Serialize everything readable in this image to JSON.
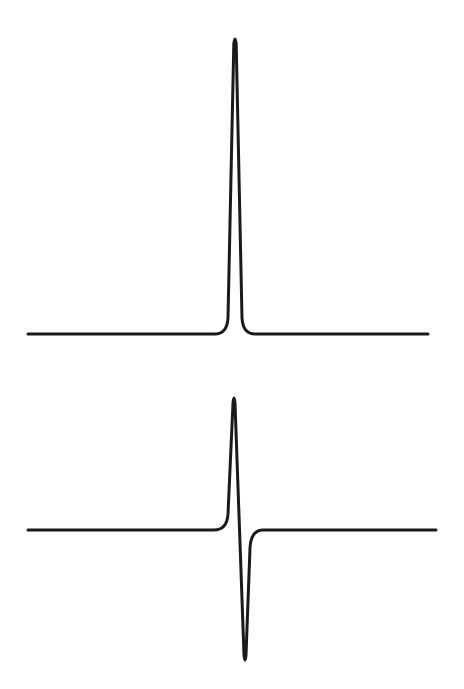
{
  "figure": {
    "background_color": "#ffffff",
    "stroke_color": "#1a1a1a",
    "stroke_width": 3,
    "panels": [
      {
        "id": "absorption",
        "shape": "lorentzian-absorption",
        "baseline_y": 334,
        "x_start": 28,
        "x_end": 428,
        "peak_x": 235,
        "peak_y": 36,
        "half_width_px": 5
      },
      {
        "id": "derivative",
        "shape": "first-derivative",
        "baseline_y": 530,
        "x_start": 28,
        "x_end": 436,
        "positive_peak_x": 234,
        "positive_peak_y": 395,
        "negative_peak_x": 245,
        "negative_peak_y": 663
      }
    ]
  }
}
